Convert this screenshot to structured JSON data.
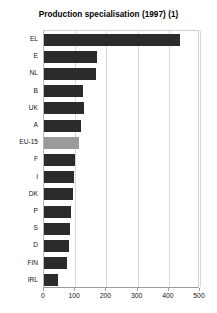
{
  "chart_data": {
    "type": "bar",
    "orientation": "horizontal",
    "title": "Production specialisation (1997) (1)",
    "xlabel": "",
    "ylabel": "",
    "categories": [
      "EL",
      "E",
      "NL",
      "B",
      "UK",
      "A",
      "EU-15",
      "F",
      "I",
      "DK",
      "P",
      "S",
      "D",
      "FIN",
      "IRL"
    ],
    "values": [
      435,
      170,
      168,
      125,
      128,
      120,
      113,
      100,
      97,
      93,
      87,
      82,
      80,
      74,
      45
    ],
    "xlim": [
      0,
      500
    ],
    "xticks": [
      0,
      100,
      200,
      300,
      400,
      500
    ],
    "xtick_labels": [
      "0",
      "100",
      "200",
      "300",
      "400",
      "500"
    ],
    "grid": true,
    "grid_axis": "x",
    "legend": null,
    "highlight_category": "EU-15",
    "colors": {
      "bar": "#2b2b2b",
      "bar_highlight": "#9b9b9b",
      "grid": "#d8d8d8",
      "axis": "#9a9a9a",
      "background": "#ffffff",
      "text": "#111111"
    }
  }
}
